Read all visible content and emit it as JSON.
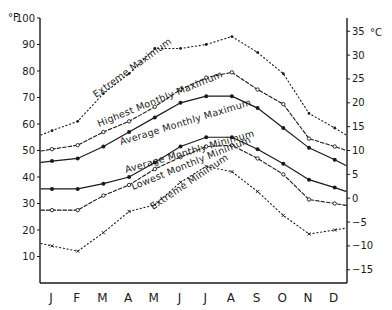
{
  "chart_data": {
    "type": "line",
    "title": "",
    "xlabel": "",
    "ylabel": "°F",
    "y2label": "°C",
    "categories": [
      "J",
      "F",
      "M",
      "A",
      "M",
      "J",
      "J",
      "A",
      "S",
      "O",
      "N",
      "D"
    ],
    "ylim": [
      0,
      100
    ],
    "y_ticks": [
      10,
      20,
      30,
      40,
      50,
      60,
      70,
      80,
      90,
      100
    ],
    "y2_ticks": [
      35,
      30,
      25,
      20,
      15,
      10,
      5,
      0,
      -5,
      -10,
      -15
    ],
    "grid": false,
    "legend": "inline labels along curves",
    "series": [
      {
        "name": "Extreme Maximum",
        "style": "dotted",
        "marker": "dot",
        "values": [
          57.5,
          61,
          71.5,
          79,
          88.5,
          88.5,
          90,
          93,
          87,
          79,
          64,
          58.5
        ]
      },
      {
        "name": "Highest Monthly Maximum",
        "style": "dashed",
        "marker": "open-circle",
        "values": [
          50.5,
          52,
          57,
          61,
          66.5,
          73,
          77.5,
          79.5,
          73,
          67.5,
          54.5,
          51.5
        ]
      },
      {
        "name": "Average Monthly Maximum",
        "style": "solid",
        "marker": "filled-dot",
        "values": [
          46,
          47,
          51.5,
          57,
          62.5,
          68,
          70.5,
          70.5,
          66,
          58.5,
          51,
          46.5
        ]
      },
      {
        "name": "Average Monthly Minimum",
        "style": "solid",
        "marker": "filled-dot",
        "values": [
          35.5,
          35.5,
          37.5,
          40,
          45.5,
          51.5,
          55,
          55,
          50.5,
          45,
          39,
          36
        ]
      },
      {
        "name": "Lowest Monthly Minimum",
        "style": "dashed",
        "marker": "open-circle",
        "values": [
          27.5,
          27.5,
          33,
          37,
          43,
          47.5,
          51.5,
          52,
          47,
          41,
          31.5,
          30
        ]
      },
      {
        "name": "Extreme Minimum",
        "style": "dotted",
        "marker": "x",
        "values": [
          14,
          12,
          19,
          27,
          29.5,
          38,
          44,
          42,
          34.5,
          25.5,
          18.5,
          20
        ]
      }
    ]
  },
  "axes": {
    "left_unit": "°F",
    "right_unit": "°C"
  },
  "labels": {
    "extreme_max": "Extreme Maximum",
    "highest_monthly_max": "Highest Monthly Maximum",
    "average_monthly_max": "Average Monthly Maximum",
    "average_monthly_min": "Average Monthly Minimum",
    "lowest_monthly_min": "Lowest Monthly Minimum",
    "extreme_min": "Extreme Minimum"
  }
}
